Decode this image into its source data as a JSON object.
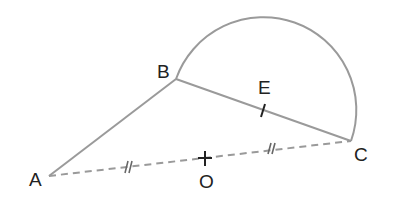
{
  "diagram": {
    "type": "geometry",
    "points": {
      "A": {
        "label": "A",
        "x": 49,
        "y": 176
      },
      "B": {
        "label": "B",
        "x": 176,
        "y": 79
      },
      "C": {
        "label": "C",
        "x": 351,
        "y": 141
      },
      "O": {
        "label": "O",
        "x": 205,
        "y": 158
      },
      "E": {
        "label": "E",
        "x": 263,
        "y": 111
      }
    },
    "segments": [
      {
        "from": "A",
        "to": "B",
        "style": "solid"
      },
      {
        "from": "B",
        "to": "C",
        "style": "solid"
      },
      {
        "from": "A",
        "to": "C",
        "style": "dashed",
        "tick_marks": "double"
      }
    ],
    "arcs": [
      {
        "type": "semicircle",
        "diameter": [
          "B",
          "C"
        ]
      }
    ],
    "marks": {
      "E": "single tick on BC",
      "O": "cross (midpoint of AC)"
    },
    "colors": {
      "line": "#999999",
      "text": "#222222"
    }
  }
}
